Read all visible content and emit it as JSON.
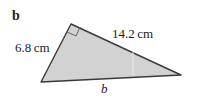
{
  "figure": {
    "part_label": "b",
    "sides": {
      "short_leg": "6.8 cm",
      "long_leg": "14.2 cm",
      "hypotenuse": "b"
    },
    "right_angle_marker": true,
    "colors": {
      "fill": "#d2d2d2",
      "stroke": "#3a3a3a"
    }
  }
}
